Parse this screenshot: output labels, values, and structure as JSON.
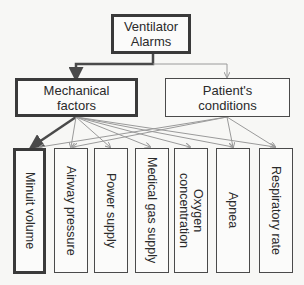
{
  "diagram": {
    "root": {
      "label_line1": "Ventilator",
      "label_line2": "Alarms"
    },
    "categories": [
      {
        "label_line1": "Mechanical",
        "label_line2": "factors",
        "emphasis": "thick"
      },
      {
        "label_line1": "Patient's",
        "label_line2": "conditions",
        "emphasis": "thin"
      }
    ],
    "leaves": [
      {
        "label": "Minuit volume",
        "emphasis": "thick"
      },
      {
        "label": "Airway pressure",
        "emphasis": "thin"
      },
      {
        "label": "Power supply",
        "emphasis": "thin"
      },
      {
        "label": "Medical gas supply",
        "emphasis": "thin"
      },
      {
        "label_line1": "Oxygen",
        "label_line2": "concentration",
        "emphasis": "thin"
      },
      {
        "label": "Apnea",
        "emphasis": "thin"
      },
      {
        "label": "Respiratory rate",
        "emphasis": "thin"
      }
    ],
    "edges": [
      {
        "from": "Ventilator Alarms",
        "to": "Mechanical factors",
        "style": "thick"
      },
      {
        "from": "Ventilator Alarms",
        "to": "Patient's conditions",
        "style": "thin"
      },
      {
        "from": "Mechanical factors",
        "to": "Minuit volume",
        "style": "thick"
      },
      {
        "from": "Mechanical factors",
        "to": "Airway pressure",
        "style": "thin"
      },
      {
        "from": "Mechanical factors",
        "to": "Power supply",
        "style": "thin"
      },
      {
        "from": "Mechanical factors",
        "to": "Medical gas supply",
        "style": "thin"
      },
      {
        "from": "Mechanical factors",
        "to": "Oxygen concentration",
        "style": "thin"
      },
      {
        "from": "Mechanical factors",
        "to": "Apnea",
        "style": "thin"
      },
      {
        "from": "Mechanical factors",
        "to": "Respiratory rate",
        "style": "thin"
      },
      {
        "from": "Patient's conditions",
        "to": "Minuit volume",
        "style": "thin"
      },
      {
        "from": "Patient's conditions",
        "to": "Airway pressure",
        "style": "thin"
      },
      {
        "from": "Patient's conditions",
        "to": "Apnea",
        "style": "thin"
      },
      {
        "from": "Patient's conditions",
        "to": "Respiratory rate",
        "style": "thin"
      }
    ],
    "colors": {
      "thick_line": "#4a4a4a",
      "thin_line": "#9a9a9a",
      "background": "#f7f7f5"
    }
  }
}
